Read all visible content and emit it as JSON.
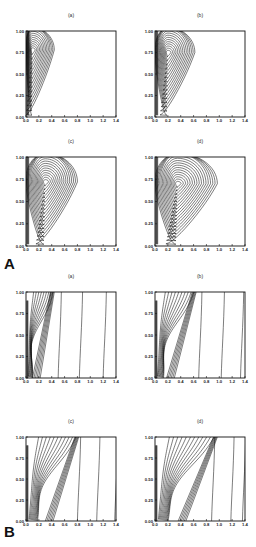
{
  "figure": {
    "group_labels": [
      "A",
      "B"
    ]
  },
  "chart_data": [
    {
      "type": "contour",
      "group": "A",
      "panel": "(a)",
      "title": "(a)",
      "xlabel": "",
      "ylabel": "",
      "xlim": [
        0.0,
        1.4
      ],
      "ylim": [
        0.0,
        1.0
      ],
      "x_ticks": [
        "0.0",
        "0.2",
        "0.4",
        "0.6",
        "0.8",
        "1.0",
        "1.2",
        "1.4"
      ],
      "y_ticks": [
        "0.00",
        "0.25",
        "0.50",
        "0.75",
        "1.00"
      ],
      "style": "closed",
      "peak": {
        "x": 0.1,
        "y": 0.78
      },
      "extent_x": 0.42,
      "levels": 14
    },
    {
      "type": "contour",
      "group": "A",
      "panel": "(b)",
      "title": "(b)",
      "xlabel": "",
      "ylabel": "",
      "xlim": [
        0.0,
        1.4
      ],
      "ylim": [
        0.0,
        1.0
      ],
      "x_ticks": [
        "0.0",
        "0.2",
        "0.4",
        "0.6",
        "0.8",
        "1.0",
        "1.2",
        "1.4"
      ],
      "y_ticks": [
        "0.00",
        "0.25",
        "0.50",
        "0.75",
        "1.00"
      ],
      "style": "closed",
      "peak": {
        "x": 0.2,
        "y": 0.75
      },
      "extent_x": 0.6,
      "levels": 15
    },
    {
      "type": "contour",
      "group": "A",
      "panel": "(c)",
      "title": "(c)",
      "xlabel": "",
      "ylabel": "",
      "xlim": [
        0.0,
        1.4
      ],
      "ylim": [
        0.0,
        1.0
      ],
      "x_ticks": [
        "0.0",
        "0.2",
        "0.4",
        "0.6",
        "0.8",
        "1.0",
        "1.2",
        "1.4"
      ],
      "y_ticks": [
        "0.00",
        "0.25",
        "0.50",
        "0.75",
        "1.00"
      ],
      "style": "closed",
      "peak": {
        "x": 0.3,
        "y": 0.72
      },
      "extent_x": 0.78,
      "levels": 16
    },
    {
      "type": "contour",
      "group": "A",
      "panel": "(d)",
      "title": "(d)",
      "xlabel": "",
      "ylabel": "",
      "xlim": [
        0.0,
        1.4
      ],
      "ylim": [
        0.0,
        1.0
      ],
      "x_ticks": [
        "0.0",
        "0.2",
        "0.4",
        "0.6",
        "0.8",
        "1.0",
        "1.2",
        "1.4"
      ],
      "y_ticks": [
        "0.00",
        "0.25",
        "0.50",
        "0.75",
        "1.00"
      ],
      "style": "closed",
      "peak": {
        "x": 0.35,
        "y": 0.7
      },
      "extent_x": 0.95,
      "levels": 17
    },
    {
      "type": "contour",
      "group": "B",
      "panel": "(a)",
      "title": "(a)",
      "xlabel": "",
      "ylabel": "",
      "xlim": [
        0.0,
        1.4
      ],
      "ylim": [
        0.0,
        1.0
      ],
      "x_ticks": [
        "0.0",
        "0.2",
        "0.4",
        "0.6",
        "0.8",
        "1.0",
        "1.2",
        "1.4"
      ],
      "y_ticks": [
        "0.00",
        "0.25",
        "0.50",
        "0.75",
        "1.00"
      ],
      "style": "open",
      "front_x_top": 0.42,
      "front_x_bottom": 0.1,
      "inner_levels": 9,
      "outer_x": [
        0.52,
        0.85,
        1.22
      ]
    },
    {
      "type": "contour",
      "group": "B",
      "panel": "(b)",
      "title": "(b)",
      "xlabel": "",
      "ylabel": "",
      "xlim": [
        0.0,
        1.4
      ],
      "ylim": [
        0.0,
        1.0
      ],
      "x_ticks": [
        "0.0",
        "0.2",
        "0.4",
        "0.6",
        "0.8",
        "1.0",
        "1.2",
        "1.4"
      ],
      "y_ticks": [
        "0.00",
        "0.25",
        "0.50",
        "0.75",
        "1.00"
      ],
      "style": "open",
      "front_x_top": 0.62,
      "front_x_bottom": 0.18,
      "inner_levels": 10,
      "outer_x": [
        0.7,
        1.05,
        1.35
      ]
    },
    {
      "type": "contour",
      "group": "B",
      "panel": "(c)",
      "title": "(c)",
      "xlabel": "",
      "ylabel": "",
      "xlim": [
        0.0,
        1.4
      ],
      "ylim": [
        0.0,
        1.0
      ],
      "x_ticks": [
        "0.0",
        "0.2",
        "0.4",
        "0.6",
        "0.8",
        "1.0",
        "1.2",
        "1.4"
      ],
      "y_ticks": [
        "0.00",
        "0.25",
        "0.50",
        "0.75",
        "1.00"
      ],
      "style": "open",
      "front_x_top": 0.8,
      "front_x_bottom": 0.3,
      "inner_levels": 11,
      "outer_x": [
        0.82,
        1.12,
        1.4
      ]
    },
    {
      "type": "contour",
      "group": "B",
      "panel": "(d)",
      "title": "(d)",
      "xlabel": "",
      "ylabel": "",
      "xlim": [
        0.0,
        1.4
      ],
      "ylim": [
        0.0,
        1.0
      ],
      "x_ticks": [
        "0.0",
        "0.2",
        "0.4",
        "0.6",
        "0.8",
        "1.0",
        "1.2",
        "1.4"
      ],
      "y_ticks": [
        "0.00",
        "0.25",
        "0.50",
        "0.75",
        "1.00"
      ],
      "style": "open",
      "front_x_top": 0.95,
      "front_x_bottom": 0.36,
      "inner_levels": 12,
      "outer_x": [
        0.9,
        1.2,
        1.38
      ]
    }
  ]
}
